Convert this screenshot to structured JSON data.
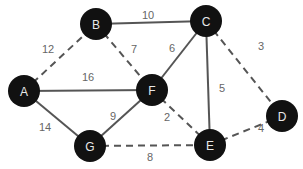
{
  "diagram": {
    "type": "weighted-undirected-graph",
    "node_radius": 16,
    "colors": {
      "node_fill": "#111111",
      "node_text": "#e8e8e8",
      "edge": "#555555",
      "weight_text": "#666666"
    },
    "nodes": [
      {
        "id": "A",
        "label": "A",
        "x": 24,
        "y": 91
      },
      {
        "id": "B",
        "label": "B",
        "x": 96,
        "y": 24
      },
      {
        "id": "C",
        "label": "C",
        "x": 206,
        "y": 21
      },
      {
        "id": "D",
        "label": "D",
        "x": 282,
        "y": 116
      },
      {
        "id": "E",
        "label": "E",
        "x": 210,
        "y": 145
      },
      {
        "id": "F",
        "label": "F",
        "x": 152,
        "y": 90
      },
      {
        "id": "G",
        "label": "G",
        "x": 90,
        "y": 146
      }
    ],
    "edges": [
      {
        "from": "A",
        "to": "B",
        "weight": "12",
        "style": "dashed",
        "lx": 48,
        "ly": 49
      },
      {
        "from": "A",
        "to": "F",
        "weight": "16",
        "style": "solid",
        "lx": 88,
        "ly": 77
      },
      {
        "from": "A",
        "to": "G",
        "weight": "14",
        "style": "solid",
        "lx": 45,
        "ly": 127
      },
      {
        "from": "B",
        "to": "C",
        "weight": "10",
        "style": "solid",
        "lx": 148,
        "ly": 15
      },
      {
        "from": "B",
        "to": "F",
        "weight": "7",
        "style": "dashed",
        "lx": 134,
        "ly": 49
      },
      {
        "from": "C",
        "to": "F",
        "weight": "6",
        "style": "solid",
        "lx": 172,
        "ly": 48
      },
      {
        "from": "C",
        "to": "E",
        "weight": "5",
        "style": "solid",
        "lx": 222,
        "ly": 88
      },
      {
        "from": "C",
        "to": "D",
        "weight": "3",
        "style": "dashed",
        "lx": 261,
        "ly": 46
      },
      {
        "from": "F",
        "to": "G",
        "weight": "9",
        "style": "solid",
        "lx": 113,
        "ly": 116
      },
      {
        "from": "F",
        "to": "E",
        "weight": "2",
        "style": "dashed",
        "lx": 167,
        "ly": 117
      },
      {
        "from": "G",
        "to": "E",
        "weight": "8",
        "style": "dashed",
        "lx": 150,
        "ly": 157
      },
      {
        "from": "E",
        "to": "D",
        "weight": "4",
        "style": "dashed",
        "lx": 261,
        "ly": 128
      }
    ]
  }
}
